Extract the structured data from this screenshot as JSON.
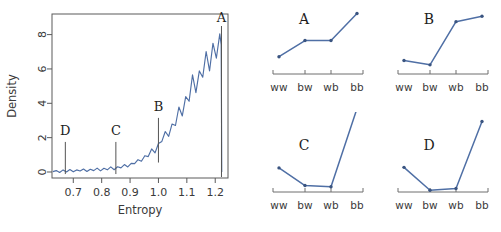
{
  "figure": {
    "background": "#ffffff",
    "series_color": "#4f6fa5",
    "axis_color": "#6e6e6e",
    "text_color": "#3a3a3a"
  },
  "main_plot": {
    "name": "entropy-density-plot",
    "xlabel": "Entropy",
    "ylabel": "Density",
    "x_ticks": [
      "0.7",
      "0.8",
      "0.9",
      "1.0",
      "1.1",
      "1.2"
    ],
    "x_tick_values": [
      0.7,
      0.8,
      0.9,
      1.0,
      1.1,
      1.2
    ],
    "y_ticks": [
      "0",
      "2",
      "4",
      "6",
      "8"
    ],
    "y_tick_values": [
      0,
      2,
      4,
      6,
      8
    ],
    "xlim": [
      0.625,
      1.245
    ],
    "ylim": [
      -0.35,
      9.2
    ],
    "markers": [
      {
        "label": "D",
        "x": 0.672
      },
      {
        "label": "C",
        "x": 0.85
      },
      {
        "label": "B",
        "x": 1.0
      },
      {
        "label": "A",
        "x": 1.222
      }
    ]
  },
  "chart_data": [
    {
      "type": "line",
      "name": "entropy-density-curve",
      "title": "",
      "xlabel": "Entropy",
      "ylabel": "Density",
      "xlim": [
        0.625,
        1.245
      ],
      "ylim": [
        -0.35,
        9.2
      ],
      "grid": false,
      "legend": "none",
      "annotations": [
        {
          "label": "D",
          "x": 0.672
        },
        {
          "label": "C",
          "x": 0.85
        },
        {
          "label": "B",
          "x": 1.0
        },
        {
          "label": "A",
          "x": 1.222
        }
      ],
      "x": [
        0.628,
        0.64,
        0.652,
        0.664,
        0.676,
        0.688,
        0.7,
        0.712,
        0.724,
        0.736,
        0.748,
        0.76,
        0.772,
        0.784,
        0.796,
        0.808,
        0.82,
        0.832,
        0.844,
        0.856,
        0.868,
        0.88,
        0.892,
        0.904,
        0.916,
        0.928,
        0.94,
        0.952,
        0.964,
        0.976,
        0.988,
        1.0,
        1.012,
        1.024,
        1.036,
        1.048,
        1.06,
        1.072,
        1.084,
        1.096,
        1.108,
        1.12,
        1.132,
        1.144,
        1.156,
        1.168,
        1.18,
        1.192,
        1.204,
        1.216,
        1.221,
        1.222,
        1.223
      ],
      "y": [
        0.02,
        0.03,
        0.03,
        0.05,
        0.04,
        0.06,
        0.08,
        0.07,
        0.09,
        0.08,
        0.11,
        0.1,
        0.13,
        0.12,
        0.16,
        0.14,
        0.19,
        0.18,
        0.24,
        0.22,
        0.32,
        0.3,
        0.42,
        0.4,
        0.58,
        0.55,
        0.78,
        0.82,
        1.02,
        1.12,
        1.32,
        1.48,
        1.95,
        2.05,
        2.35,
        2.55,
        2.95,
        3.35,
        3.65,
        4.05,
        4.45,
        5.05,
        5.15,
        5.45,
        5.95,
        6.25,
        6.55,
        6.95,
        7.15,
        7.4,
        7.42,
        4.0,
        0.0
      ]
    },
    {
      "type": "line",
      "name": "profile-A",
      "title": "A",
      "categories": [
        "ww",
        "bw",
        "wb",
        "bb"
      ],
      "values": [
        1.6,
        3.1,
        3.1,
        5.6
      ],
      "ylim": [
        0,
        6.3
      ],
      "xlabel": "",
      "ylabel": "",
      "grid": false,
      "legend": "none"
    },
    {
      "type": "line",
      "name": "profile-B",
      "title": "B",
      "categories": [
        "ww",
        "bw",
        "wb",
        "bb"
      ],
      "values": [
        1.25,
        0.85,
        4.85,
        5.35
      ],
      "ylim": [
        0,
        6.3
      ],
      "xlabel": "",
      "ylabel": "",
      "grid": false,
      "legend": "none"
    },
    {
      "type": "line",
      "name": "profile-C",
      "title": "C",
      "categories": [
        "ww",
        "bw",
        "wb",
        "bb"
      ],
      "values": [
        2.05,
        0.55,
        0.45,
        7.1
      ],
      "ylim": [
        0,
        6.3
      ],
      "xlabel": "",
      "ylabel": "",
      "grid": false,
      "legend": "none"
    },
    {
      "type": "line",
      "name": "profile-D",
      "title": "D",
      "categories": [
        "ww",
        "bw",
        "wb",
        "bb"
      ],
      "values": [
        2.1,
        0.15,
        0.3,
        6.0
      ],
      "ylim": [
        0,
        6.3
      ],
      "xlabel": "",
      "ylabel": "",
      "grid": false,
      "legend": "none"
    }
  ],
  "panels": {
    "categories": [
      "ww",
      "bw",
      "wb",
      "bb"
    ],
    "letters": [
      "A",
      "B",
      "C",
      "D"
    ]
  }
}
